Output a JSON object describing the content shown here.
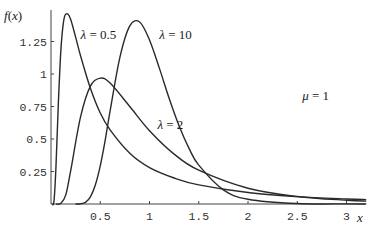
{
  "chart_data": {
    "type": "line",
    "title": "",
    "xlabel": "x",
    "ylabel": "f(x)",
    "xlim": [
      0,
      3.2
    ],
    "ylim": [
      0,
      1.5
    ],
    "grid": false,
    "legend": "inline labels",
    "x_ticks": [
      0.5,
      1,
      1.5,
      2,
      2.5,
      3
    ],
    "x_tick_labels": [
      "0.5",
      "1",
      "1.5",
      "2",
      "2.5",
      "3"
    ],
    "y_ticks": [
      0.25,
      0.5,
      0.75,
      1,
      1.25
    ],
    "y_tick_labels": [
      "0.25",
      "0.5",
      "0.75",
      "1",
      "1.25"
    ],
    "annotations": [
      {
        "text": "μ = 1",
        "x": 2.55,
        "y": 0.8
      },
      {
        "text": "λ = 0.5",
        "x": 0.3,
        "y": 1.27
      },
      {
        "text": "λ = 10",
        "x": 1.1,
        "y": 1.27
      },
      {
        "text": "λ = 2",
        "x": 1.08,
        "y": 0.58
      }
    ],
    "series": [
      {
        "name": "λ = 0.5",
        "x": [
          0.01,
          0.03,
          0.05,
          0.075,
          0.1,
          0.125,
          0.15,
          0.2,
          0.3,
          0.4,
          0.5,
          0.6,
          0.8,
          1,
          1.25,
          1.5,
          2,
          2.5,
          3,
          3.2
        ],
        "values": [
          0.0,
          0.02,
          0.28,
          0.78,
          1.18,
          1.39,
          1.46,
          1.42,
          1.14,
          0.89,
          0.7,
          0.57,
          0.39,
          0.28,
          0.2,
          0.147,
          0.088,
          0.057,
          0.039,
          0.034
        ]
      },
      {
        "name": "λ = 2",
        "x": [
          0.05,
          0.1,
          0.15,
          0.2,
          0.3,
          0.4,
          0.5,
          0.6,
          0.8,
          1,
          1.25,
          1.5,
          2,
          2.5,
          3,
          3.2
        ],
        "values": [
          0.0,
          0.005,
          0.07,
          0.257,
          0.67,
          0.907,
          0.968,
          0.93,
          0.75,
          0.564,
          0.384,
          0.26,
          0.121,
          0.058,
          0.029,
          0.022
        ]
      },
      {
        "name": "λ = 10",
        "x": [
          0.25,
          0.3,
          0.35,
          0.4,
          0.45,
          0.5,
          0.55,
          0.6,
          0.7,
          0.8,
          0.9,
          1,
          1.1,
          1.2,
          1.3,
          1.4,
          1.5,
          1.75,
          2,
          2.5,
          3,
          3.2
        ],
        "values": [
          0.0,
          0.002,
          0.013,
          0.055,
          0.146,
          0.293,
          0.49,
          0.716,
          1.13,
          1.37,
          1.4,
          1.262,
          1.045,
          0.812,
          0.602,
          0.43,
          0.299,
          0.109,
          0.037,
          0.0035,
          0.001,
          0.0005
        ]
      }
    ]
  },
  "labels": {
    "y_axis": "f(x)",
    "x_axis": "x",
    "mu": "μ = 1"
  }
}
